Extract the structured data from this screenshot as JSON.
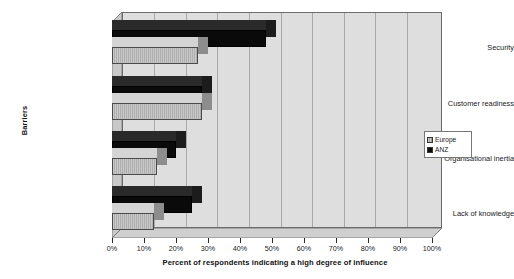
{
  "chart_data": {
    "type": "bar",
    "orientation": "horizontal",
    "title": "",
    "xlabel": "Percent of respondents indicating a high degree of influence",
    "ylabel": "Barriers",
    "categories": [
      "Security",
      "Customer readiness",
      "Organisational inertia",
      "Lack of knowledge"
    ],
    "series": [
      {
        "name": "Europe",
        "values": [
          27,
          28,
          14,
          13
        ],
        "color": "#b9b9b9"
      },
      {
        "name": "ANZ",
        "values": [
          48,
          28,
          20,
          25
        ],
        "color": "#0a0a0a"
      }
    ],
    "xlim": [
      0,
      100
    ],
    "xtick_labels": [
      "0%",
      "10%",
      "20%",
      "30%",
      "40%",
      "50%",
      "60%",
      "70%",
      "80%",
      "90%",
      "100%"
    ],
    "xtick_values": [
      0,
      10,
      20,
      30,
      40,
      50,
      60,
      70,
      80,
      90,
      100
    ],
    "grid": true,
    "grid_axis": "x",
    "legend_position": "right",
    "style": "3d-bar"
  },
  "axes": {
    "y_title": "Barriers",
    "x_title": "Percent of respondents indicating a high degree of influence"
  },
  "legend": {
    "items": [
      {
        "label": "Europe",
        "swatch": "europe-swatch"
      },
      {
        "label": "ANZ",
        "swatch": "anz-swatch"
      }
    ]
  }
}
